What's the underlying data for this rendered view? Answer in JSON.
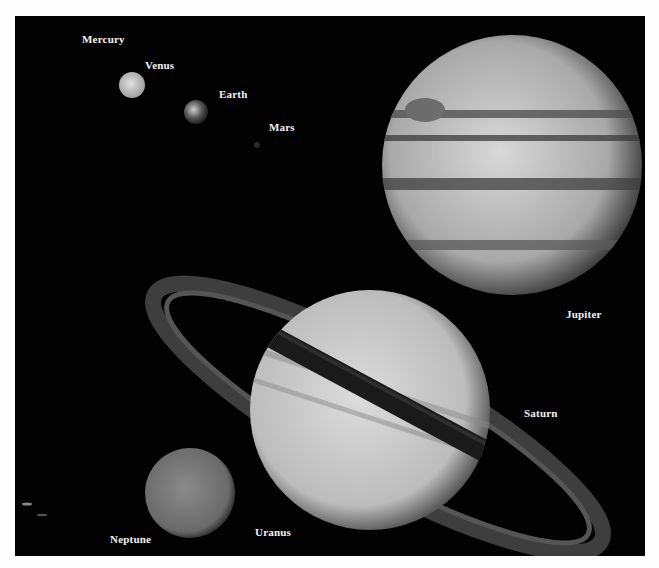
{
  "figure": {
    "background_color": "#020202",
    "border_color": "#fdfdfd"
  },
  "labels": {
    "mercury": "Mercury",
    "venus": "Venus",
    "earth": "Earth",
    "mars": "Mars",
    "jupiter": "Jupiter",
    "saturn": "Saturn",
    "uranus": "Uranus",
    "neptune": "Neptune"
  },
  "planets": [
    {
      "name": "Venus",
      "cx": 132,
      "cy": 85,
      "r": 13
    },
    {
      "name": "Earth",
      "cx": 196,
      "cy": 112,
      "r": 12
    },
    {
      "name": "Mars",
      "cx": 257,
      "cy": 145,
      "r": 3
    },
    {
      "name": "Jupiter",
      "cx": 512,
      "cy": 165,
      "r": 130
    },
    {
      "name": "Saturn",
      "cx": 370,
      "cy": 410,
      "r": 120
    },
    {
      "name": "Uranus",
      "cx": 190,
      "cy": 493,
      "r": 45
    }
  ]
}
